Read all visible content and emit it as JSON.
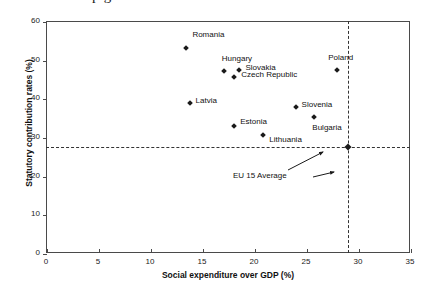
{
  "figure": {
    "partial_title_fragment": "p  g",
    "background_color": "#ffffff",
    "marker_color": "#1a1a1a",
    "axis_color": "#4a4a4a",
    "reference_line_color": "#333333"
  },
  "chart_data": {
    "type": "scatter",
    "title": "",
    "xlabel": "Social expenditure over GDP (%)",
    "ylabel": "Statutory contribution rates (%)",
    "xlim": [
      0,
      35
    ],
    "ylim": [
      0,
      60
    ],
    "xticks": [
      0,
      5,
      10,
      15,
      20,
      25,
      30,
      35
    ],
    "yticks": [
      0,
      10,
      20,
      30,
      40,
      50,
      60
    ],
    "grid": false,
    "legend": null,
    "points": [
      {
        "label": "Romania",
        "x": 13.5,
        "y": 53.0,
        "label_dx": 6,
        "label_dy": -14
      },
      {
        "label": "Hungary",
        "x": 17.1,
        "y": 47.1,
        "label_dx": -2,
        "label_dy": -13
      },
      {
        "label": "Slovakia",
        "x": 18.6,
        "y": 47.3,
        "label_dx": 6,
        "label_dy": -3
      },
      {
        "label": "Czech Republic",
        "x": 18.1,
        "y": 45.5,
        "label_dx": 7,
        "label_dy": -3
      },
      {
        "label": "Poland",
        "x": 28.0,
        "y": 47.3,
        "label_dx": -9,
        "label_dy": -13
      },
      {
        "label": "Latvia",
        "x": 13.8,
        "y": 38.8,
        "label_dx": 6,
        "label_dy": -3
      },
      {
        "label": "Slovenia",
        "x": 24.0,
        "y": 37.7,
        "label_dx": 6,
        "label_dy": -3
      },
      {
        "label": "Bulgaria",
        "x": 25.8,
        "y": 35.2,
        "label_dx": -2,
        "label_dy": 10
      },
      {
        "label": "Estonia",
        "x": 18.1,
        "y": 32.8,
        "label_dx": 6,
        "label_dy": -5
      },
      {
        "label": "Lithuania",
        "x": 20.9,
        "y": 30.5,
        "label_dx": 6,
        "label_dy": 4
      }
    ],
    "reference_lines": {
      "horizontal_value": 27.4,
      "vertical_value": 29.0,
      "intersection_marker": true,
      "annotation": "EU 15 Average"
    }
  }
}
